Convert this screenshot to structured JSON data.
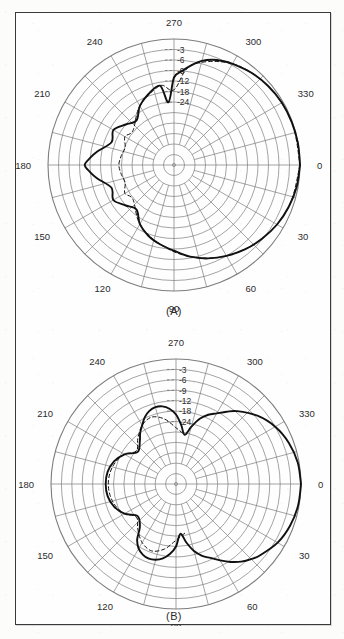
{
  "figure": {
    "panels": [
      {
        "id": "A",
        "caption": "(A)"
      },
      {
        "id": "B",
        "caption": "(B)"
      }
    ]
  },
  "chart_data": [
    {
      "type": "line",
      "subtype": "polar-antenna-pattern",
      "panel": "A",
      "title": "(A)",
      "angle_unit": "degrees",
      "angle_ticks": [
        "0",
        "30",
        "60",
        "90",
        "120",
        "150",
        "180",
        "210",
        "240",
        "270",
        "300",
        "330"
      ],
      "angle_tick_step": 30,
      "minor_angle_step": 15,
      "radial_label_axis_angle": 270,
      "radial_ticks": [
        "-3",
        "-6",
        "-9",
        "-12",
        "-18",
        "-24"
      ],
      "radial_unit": "dB",
      "radial_max_db": 0,
      "radial_min_db": -30,
      "grid": true,
      "legend": null,
      "series": [
        {
          "name": "measured",
          "style": "solid",
          "color": "#111111",
          "angles_deg": [
            0,
            10,
            20,
            30,
            40,
            50,
            60,
            70,
            80,
            90,
            100,
            110,
            120,
            130,
            140,
            150,
            160,
            170,
            175,
            180,
            185,
            190,
            200,
            210,
            220,
            230,
            240,
            250,
            260,
            265,
            270,
            275,
            280,
            285,
            290,
            295,
            300,
            310,
            320,
            330,
            340,
            350,
            360
          ],
          "values_db": [
            0,
            -0.4,
            -1.1,
            -2.0,
            -3.2,
            -4.5,
            -6.0,
            -7.6,
            -9.4,
            -11.5,
            -14.0,
            -17.0,
            -21.0,
            -25.5,
            -24.0,
            -20.0,
            -22.0,
            -15.5,
            -12.0,
            -10.5,
            -12.0,
            -15.5,
            -22.0,
            -20.0,
            -24.0,
            -25.5,
            -21.0,
            -17.0,
            -14.0,
            -24.0,
            -11.0,
            -9.0,
            -7.0,
            -5.2,
            -4.0,
            -3.2,
            -2.6,
            -1.6,
            -0.9,
            -0.4,
            -0.2,
            -0.05,
            0
          ]
        },
        {
          "name": "computed",
          "style": "dashed",
          "color": "#111111",
          "angles_deg": [
            0,
            20,
            40,
            60,
            80,
            100,
            120,
            140,
            150,
            160,
            170,
            180,
            190,
            200,
            210,
            220,
            240,
            260,
            270,
            280,
            300,
            320,
            340,
            360
          ],
          "values_db": [
            0,
            -1.1,
            -3.2,
            -6.0,
            -9.4,
            -14.0,
            -21.0,
            -27.0,
            -26.0,
            -27.5,
            -27.0,
            -26.5,
            -27.0,
            -27.5,
            -26.0,
            -27.0,
            -21.0,
            -14.0,
            -17.0,
            -7.0,
            -2.6,
            -0.9,
            -0.2,
            0
          ]
        }
      ]
    },
    {
      "type": "line",
      "subtype": "polar-antenna-pattern",
      "panel": "B",
      "title": "(B)",
      "angle_unit": "degrees",
      "angle_ticks": [
        "0",
        "30",
        "60",
        "90",
        "120",
        "150",
        "180",
        "210",
        "240",
        "270",
        "300",
        "330"
      ],
      "angle_tick_step": 30,
      "minor_angle_step": 15,
      "radial_label_axis_angle": 270,
      "radial_ticks": [
        "-3",
        "-6",
        "-9",
        "-12",
        "-18",
        "-24"
      ],
      "radial_unit": "dB",
      "radial_max_db": 0,
      "radial_min_db": -30,
      "grid": true,
      "legend": null,
      "series": [
        {
          "name": "measured",
          "style": "solid",
          "color": "#111111",
          "angles_deg": [
            0,
            10,
            20,
            30,
            40,
            45,
            50,
            55,
            60,
            65,
            70,
            75,
            80,
            85,
            90,
            95,
            100,
            105,
            110,
            115,
            120,
            125,
            130,
            140,
            150,
            160,
            170,
            180,
            190,
            200,
            210,
            220,
            230,
            235,
            240,
            245,
            250,
            255,
            260,
            265,
            270,
            275,
            280,
            285,
            290,
            295,
            300,
            305,
            310,
            320,
            330,
            340,
            350,
            360
          ],
          "values_db": [
            0,
            -0.3,
            -1.0,
            -2.2,
            -4.2,
            -5.4,
            -6.8,
            -8.6,
            -10.6,
            -13.0,
            -16.0,
            -20.0,
            -25.0,
            -28.0,
            -24.0,
            -19.5,
            -16.5,
            -14.8,
            -14.2,
            -15.0,
            -17.0,
            -21.0,
            -26.0,
            -28.0,
            -25.0,
            -22.0,
            -20.0,
            -19.5,
            -20.0,
            -22.0,
            -25.0,
            -28.0,
            -26.0,
            -24.0,
            -21.0,
            -17.5,
            -15.2,
            -14.2,
            -14.6,
            -16.5,
            -20.0,
            -25.0,
            -28.0,
            -25.0,
            -20.0,
            -16.0,
            -13.0,
            -10.6,
            -8.6,
            -5.4,
            -3.0,
            -1.4,
            -0.4,
            0
          ]
        },
        {
          "name": "computed",
          "style": "dashed",
          "color": "#111111",
          "angles_deg": [
            80,
            90,
            100,
            110,
            120,
            130,
            140,
            150,
            160,
            170,
            180,
            190,
            200,
            210,
            220,
            230,
            240,
            250,
            260,
            270,
            280
          ],
          "values_db": [
            -28.0,
            -26.0,
            -22.0,
            -19.0,
            -21.0,
            -25.0,
            -27.5,
            -25.0,
            -23.0,
            -21.5,
            -21.0,
            -21.5,
            -23.0,
            -25.0,
            -27.5,
            -25.0,
            -21.0,
            -19.0,
            -22.0,
            -26.0,
            -28.0
          ]
        }
      ]
    }
  ]
}
